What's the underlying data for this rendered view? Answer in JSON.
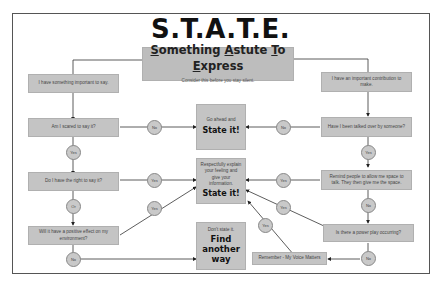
{
  "title": "S.T.A.T.E.",
  "header": {
    "title_parts": [
      "S",
      "omething ",
      "A",
      "stute ",
      "T",
      "o ",
      "E",
      "xpress"
    ],
    "title": "Something Astute To Express",
    "subtitle": "Consider this before you stay silent."
  },
  "left_branch": {
    "start": "I have something important to say.",
    "q1": "Am I scared to say it?",
    "q2": "Do I have the right to say it?",
    "q3": "Will it have a positive effect on my environment?"
  },
  "right_branch": {
    "start": "I have an important contribution to make.",
    "q1": "Have I been talked over by someone?",
    "q2": "Remind people to allow me space to talk. They then give me the space.",
    "q3": "Is there a power play occurring?",
    "remember": "Remember - My Voice Matters"
  },
  "outcomes": {
    "go_ahead": {
      "small": "Go ahead and",
      "big": "State it!"
    },
    "respectfully": {
      "small": "Respectfully explain your feeling and give your information.",
      "big": "State it!"
    },
    "find_another": {
      "small": "Don't state it.",
      "big": "Find another way"
    }
  },
  "connectors": {
    "left_q1_right": "No",
    "left_q1_down": "Yes",
    "left_q2_right": "Yes",
    "left_q2_down": "Or",
    "left_q3_diag": "Yes",
    "left_q3_down": "No",
    "right_q1_left": "No",
    "right_q1_down": "Yes",
    "right_q2_left": "Yes",
    "right_q2_down": "No",
    "right_q3_diag": "Yes",
    "right_q3_down": "No",
    "remember_diag": "Yes"
  }
}
